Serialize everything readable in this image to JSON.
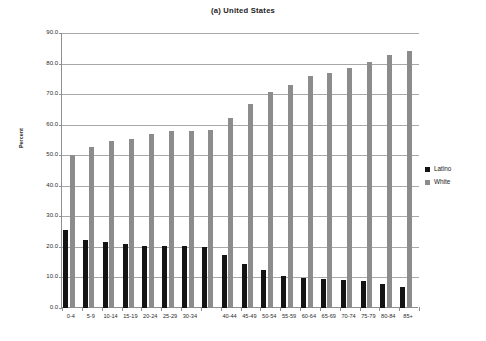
{
  "chart_data": {
    "type": "bar",
    "title": "(a)  United States",
    "xlabel": "",
    "ylabel": "Percent",
    "ylim": [
      0.0,
      90.0
    ],
    "ytick_step": 10.0,
    "ytick_labels": [
      "0.0",
      "10.0",
      "20.0",
      "30.0",
      "40.0",
      "50.0",
      "60.0",
      "70.0",
      "80.0",
      "90.0"
    ],
    "grid": true,
    "legend_position": "right",
    "categories": [
      "0-4",
      "5-9",
      "10-14",
      "15-19",
      "20-24",
      "25-29",
      "30-34",
      "",
      "40-44",
      "45-49",
      "50-54",
      "55-59",
      "60-64",
      "65-69",
      "70-74",
      "75-79",
      "80-84",
      "85+"
    ],
    "series": [
      {
        "name": "Latino",
        "color": "#141414",
        "values": [
          25.5,
          22.4,
          21.5,
          21.0,
          20.3,
          20.2,
          20.4,
          20.0,
          17.5,
          14.5,
          12.3,
          10.6,
          9.8,
          9.5,
          9.3,
          8.7,
          8.0,
          7.0
        ]
      },
      {
        "name": "White",
        "color": "#8c8c8c",
        "values": [
          50.2,
          52.8,
          54.6,
          55.3,
          56.8,
          57.8,
          58.0,
          58.2,
          62.2,
          66.8,
          70.6,
          73.0,
          75.9,
          77.0,
          78.4,
          80.6,
          82.8,
          84.2
        ]
      }
    ]
  },
  "legend": {
    "items": [
      {
        "label": "Latino",
        "color": "#141414"
      },
      {
        "label": "White",
        "color": "#8c8c8c"
      }
    ]
  }
}
